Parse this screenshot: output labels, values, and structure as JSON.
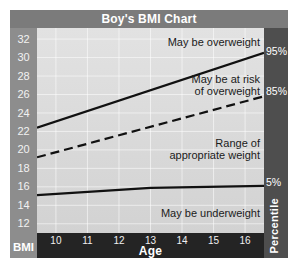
{
  "chart_data": {
    "type": "line",
    "title": "Boy's BMI Chart",
    "xlabel": "Age",
    "ylabel_left": "BMI",
    "ylabel_right": "Percentile",
    "x_ticks": [
      10,
      11,
      12,
      13,
      14,
      15,
      16
    ],
    "y_ticks": [
      32,
      30,
      28,
      26,
      24,
      22,
      20,
      18,
      16,
      14,
      12
    ],
    "xlim": [
      9.4,
      16.6
    ],
    "ylim": [
      11.0,
      33.2
    ],
    "grid": true,
    "series": [
      {
        "name": "95%",
        "style": "solid",
        "points": [
          [
            9.4,
            22.4
          ],
          [
            16.6,
            30.5
          ]
        ]
      },
      {
        "name": "85%",
        "style": "dashed",
        "points": [
          [
            9.4,
            19.2
          ],
          [
            16.6,
            25.8
          ]
        ]
      },
      {
        "name": "5%",
        "style": "solid",
        "points": [
          [
            9.4,
            15.1
          ],
          [
            13.0,
            15.9
          ],
          [
            16.6,
            16.1
          ]
        ]
      }
    ],
    "right_labels": [
      "95%",
      "85%",
      "5%"
    ],
    "annotations": {
      "overweight": "May be overweight",
      "at_risk": "May be at risk\nof overweight",
      "range": "Range of\nappropriate weight",
      "underweight": "May be underweight"
    }
  },
  "colors": {
    "header_bg": "#7b7b7b",
    "leftcol_bg": "#8d8d8d",
    "rightcol_bg": "#4e4e4e",
    "bottombar_bg": "#242424",
    "plot_bg": "#d9d9d9",
    "line": "#111111"
  }
}
